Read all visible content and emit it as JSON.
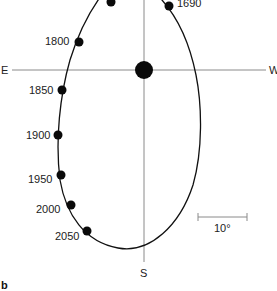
{
  "figure": {
    "panel_label": "b",
    "axes": {
      "east_label": "E",
      "west_label": "W",
      "south_label": "S"
    },
    "scale_bar": {
      "label": "10°"
    },
    "points": [
      {
        "year": "",
        "label": ""
      },
      {
        "year": "1690",
        "label": "1690"
      },
      {
        "year": "1800",
        "label": "1800"
      },
      {
        "year": "1850",
        "label": "1850"
      },
      {
        "year": "1900",
        "label": "1900"
      },
      {
        "year": "1950",
        "label": "1950"
      },
      {
        "year": "2000",
        "label": "2000"
      },
      {
        "year": "2050",
        "label": "2050"
      }
    ],
    "center_marker": "geographic-pole"
  }
}
